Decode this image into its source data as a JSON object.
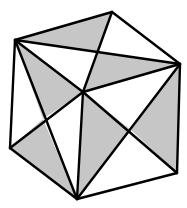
{
  "diagram": {
    "colors": {
      "shade": "#c6c6c6",
      "line": "#000000",
      "background": "#ffffff"
    },
    "line_width": 2.4,
    "vertices": {
      "TL": [
        15,
        40
      ],
      "T": [
        112,
        12
      ],
      "R": [
        180,
        64
      ],
      "BR": [
        177,
        173
      ],
      "B": [
        77,
        199
      ],
      "BL": [
        10,
        148
      ],
      "C": [
        83,
        92
      ],
      "P1": [
        99,
        52
      ],
      "P2": [
        131,
        130
      ],
      "P3": [
        43,
        119
      ]
    },
    "shaded_triangles": [
      [
        "TL",
        "T",
        "P1"
      ],
      [
        "P1",
        "C",
        "R"
      ],
      [
        "TL",
        "C",
        "P3"
      ],
      [
        "BL",
        "P3",
        "B"
      ],
      [
        "C",
        "B",
        "P2"
      ],
      [
        "P2",
        "R",
        "BR"
      ]
    ],
    "edges": [
      [
        "TL",
        "T"
      ],
      [
        "T",
        "R"
      ],
      [
        "R",
        "BR"
      ],
      [
        "BR",
        "B"
      ],
      [
        "B",
        "BL"
      ],
      [
        "BL",
        "TL"
      ],
      [
        "TL",
        "R"
      ],
      [
        "T",
        "C"
      ],
      [
        "C",
        "R"
      ],
      [
        "TL",
        "C"
      ],
      [
        "TL",
        "B"
      ],
      [
        "BL",
        "C"
      ],
      [
        "C",
        "B"
      ],
      [
        "C",
        "BR"
      ],
      [
        "R",
        "B"
      ]
    ]
  }
}
